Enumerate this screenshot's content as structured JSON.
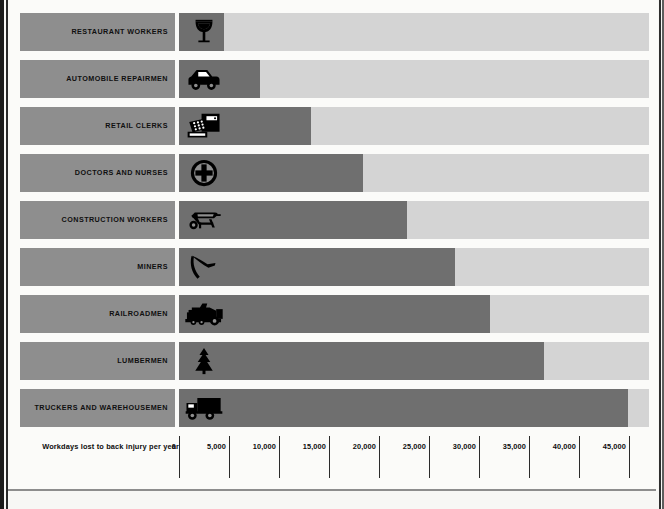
{
  "chart_data": {
    "type": "bar",
    "orientation": "horizontal",
    "title": "",
    "xlabel": "Workdays lost to back injury per year",
    "ylabel": "",
    "xlim": [
      0,
      47000
    ],
    "grid": false,
    "legend": "none",
    "tick_labels": [
      "0",
      "5,000",
      "10,000",
      "15,000",
      "20,000",
      "25,000",
      "30,000",
      "35,000",
      "40,000",
      "45,000"
    ],
    "tick_values": [
      0,
      5000,
      10000,
      15000,
      20000,
      25000,
      30000,
      35000,
      40000,
      45000
    ],
    "categories": [
      "RESTAURANT WORKERS",
      "AUTOMOBILE REPAIRMEN",
      "RETAIL CLERKS",
      "DOCTORS AND NURSES",
      "CONSTRUCTION WORKERS",
      "MINERS",
      "RAILROADMEN",
      "LUMBERMEN",
      "TRUCKERS AND WAREHOUSEMEN"
    ],
    "values": [
      4500,
      8100,
      13200,
      18400,
      22800,
      27600,
      31100,
      36500,
      44900
    ],
    "icons": [
      "wine-glass-icon",
      "car-icon",
      "cash-register-icon",
      "medical-cross-icon",
      "wheelbarrow-icon",
      "pickaxe-icon",
      "locomotive-icon",
      "pine-tree-icon",
      "box-truck-icon"
    ]
  },
  "colors": {
    "bar_fill": "#6f6f6f",
    "bar_track": "#d4d4d4",
    "label_box": "#8e8e8e",
    "icon": "#000000",
    "page": "#fbfbf9",
    "axis_text": "#0d0d0d"
  },
  "axis": {
    "caption": "Workdays lost to back injury per year"
  },
  "rows": [
    {
      "label": "RESTAURANT WORKERS",
      "value": 4500,
      "value_text": "4,500",
      "icon": "wine-glass-icon"
    },
    {
      "label": "AUTOMOBILE REPAIRMEN",
      "value": 8100,
      "value_text": "8,100",
      "icon": "car-icon"
    },
    {
      "label": "RETAIL CLERKS",
      "value": 13200,
      "value_text": "13,200",
      "icon": "cash-register-icon"
    },
    {
      "label": "DOCTORS AND NURSES",
      "value": 18400,
      "value_text": "18,400",
      "icon": "medical-cross-icon"
    },
    {
      "label": "CONSTRUCTION WORKERS",
      "value": 22800,
      "value_text": "22,800",
      "icon": "wheelbarrow-icon"
    },
    {
      "label": "MINERS",
      "value": 27600,
      "value_text": "27,600",
      "icon": "pickaxe-icon"
    },
    {
      "label": "RAILROADMEN",
      "value": 31100,
      "value_text": "31,100",
      "icon": "locomotive-icon"
    },
    {
      "label": "LUMBERMEN",
      "value": 36500,
      "value_text": "36,500",
      "icon": "pine-tree-icon"
    },
    {
      "label": "TRUCKERS AND WAREHOUSEMEN",
      "value": 44900,
      "value_text": "44,900",
      "icon": "box-truck-icon"
    }
  ],
  "ticks": [
    {
      "label": "0",
      "value": 0
    },
    {
      "label": "5,000",
      "value": 5000
    },
    {
      "label": "10,000",
      "value": 10000
    },
    {
      "label": "15,000",
      "value": 15000
    },
    {
      "label": "20,000",
      "value": 20000
    },
    {
      "label": "25,000",
      "value": 25000
    },
    {
      "label": "30,000",
      "value": 30000
    },
    {
      "label": "35,000",
      "value": 35000
    },
    {
      "label": "40,000",
      "value": 40000
    },
    {
      "label": "45,000",
      "value": 45000
    }
  ]
}
